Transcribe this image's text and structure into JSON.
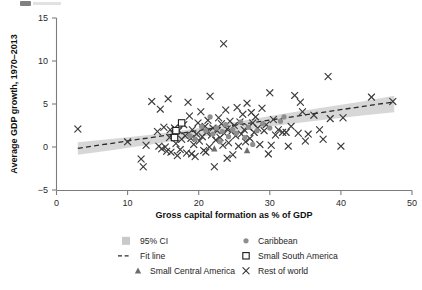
{
  "figure": {
    "name": "scatterplot-gdp-growth-vs-capital-formation"
  },
  "chart_data": {
    "type": "scatter",
    "title": "",
    "xlabel": "Gross capital formation as % of GDP",
    "ylabel": "Average GDP growth, 1970–2013",
    "xlim": [
      0,
      50
    ],
    "ylim": [
      -5,
      15
    ],
    "xticks": [
      0,
      10,
      20,
      30,
      40,
      50
    ],
    "yticks": [
      -5,
      0,
      5,
      10,
      15
    ],
    "xticklabels": [
      "0",
      "10",
      "20",
      "30",
      "40",
      "50"
    ],
    "yticklabels": [
      "−5",
      "0",
      "5",
      "10",
      "15"
    ],
    "grid": false,
    "legend_position": "below-axis",
    "fit_line": {
      "label": "Fit line",
      "style": "dashed",
      "color": "#2a2a2a",
      "x": [
        3.0,
        47.5
      ],
      "y": [
        -0.15,
        5.25
      ],
      "slope": 0.1213,
      "intercept": -0.514
    },
    "confidence_band": {
      "label": "95% CI",
      "level": 0.95,
      "color": "#c9c9c9",
      "x": [
        3.0,
        8.0,
        13.0,
        18.0,
        23.0,
        28.0,
        33.0,
        38.0,
        43.0,
        47.5
      ],
      "upper": [
        0.55,
        0.95,
        1.4,
        1.95,
        2.6,
        3.3,
        4.0,
        4.65,
        5.3,
        5.95
      ],
      "lower": [
        -0.9,
        -0.35,
        0.25,
        0.9,
        1.55,
        2.15,
        2.7,
        3.2,
        3.65,
        4.05
      ]
    },
    "series": [
      {
        "name": "Rest of world",
        "marker": "x",
        "color": "#3a3a3a",
        "points": [
          [
            3.0,
            2.1
          ],
          [
            10.0,
            0.6
          ],
          [
            11.9,
            -1.4
          ],
          [
            12.2,
            -2.3
          ],
          [
            12.6,
            0.2
          ],
          [
            13.4,
            5.3
          ],
          [
            14.2,
            1.8
          ],
          [
            14.4,
            0.1
          ],
          [
            14.6,
            4.4
          ],
          [
            14.8,
            -0.2
          ],
          [
            15.1,
            2.3
          ],
          [
            15.3,
            0.0
          ],
          [
            15.5,
            -0.5
          ],
          [
            15.7,
            5.6
          ],
          [
            15.9,
            1.1
          ],
          [
            16.1,
            -0.6
          ],
          [
            16.4,
            1.6
          ],
          [
            16.6,
            2.2
          ],
          [
            16.8,
            0.4
          ],
          [
            17.0,
            -1.0
          ],
          [
            17.2,
            1.9
          ],
          [
            17.4,
            -0.3
          ],
          [
            17.6,
            0.9
          ],
          [
            17.9,
            2.6
          ],
          [
            18.1,
            1.3
          ],
          [
            18.3,
            -0.7
          ],
          [
            18.5,
            5.2
          ],
          [
            18.7,
            3.6
          ],
          [
            18.9,
            1.0
          ],
          [
            19.1,
            2.0
          ],
          [
            19.3,
            0.3
          ],
          [
            19.5,
            -1.1
          ],
          [
            19.7,
            1.5
          ],
          [
            19.9,
            2.8
          ],
          [
            20.1,
            0.7
          ],
          [
            20.3,
            4.1
          ],
          [
            20.5,
            1.2
          ],
          [
            20.7,
            -0.4
          ],
          [
            20.9,
            2.4
          ],
          [
            21.1,
            1.7
          ],
          [
            21.3,
            3.1
          ],
          [
            21.5,
            0.0
          ],
          [
            21.6,
            5.9
          ],
          [
            21.8,
            1.4
          ],
          [
            22.0,
            2.2
          ],
          [
            22.2,
            -2.3
          ],
          [
            22.4,
            0.8
          ],
          [
            22.6,
            1.9
          ],
          [
            22.8,
            3.4
          ],
          [
            23.0,
            1.1
          ],
          [
            23.2,
            2.7
          ],
          [
            23.4,
            0.2
          ],
          [
            23.5,
            12.0
          ],
          [
            23.6,
            1.6
          ],
          [
            23.8,
            4.3
          ],
          [
            24.0,
            2.1
          ],
          [
            24.2,
            0.5
          ],
          [
            24.4,
            3.0
          ],
          [
            24.6,
            1.8
          ],
          [
            24.8,
            -0.9
          ],
          [
            25.0,
            2.5
          ],
          [
            25.2,
            1.3
          ],
          [
            25.4,
            4.6
          ],
          [
            25.6,
            0.1
          ],
          [
            25.8,
            2.9
          ],
          [
            26.0,
            1.5
          ],
          [
            26.2,
            3.8
          ],
          [
            26.4,
            2.0
          ],
          [
            26.6,
            0.6
          ],
          [
            26.8,
            5.1
          ],
          [
            27.0,
            2.3
          ],
          [
            27.2,
            1.0
          ],
          [
            27.4,
            4.0
          ],
          [
            27.6,
            2.8
          ],
          [
            27.8,
            1.7
          ],
          [
            28.0,
            3.5
          ],
          [
            28.3,
            2.2
          ],
          [
            28.6,
            0.3
          ],
          [
            28.9,
            4.5
          ],
          [
            29.2,
            1.9
          ],
          [
            29.5,
            2.6
          ],
          [
            29.8,
            -0.8
          ],
          [
            30.0,
            6.3
          ],
          [
            30.2,
            0.2
          ],
          [
            30.5,
            3.2
          ],
          [
            30.8,
            1.4
          ],
          [
            31.2,
            2.0
          ],
          [
            31.8,
            1.7
          ],
          [
            32.3,
            1.7
          ],
          [
            32.6,
            0.1
          ],
          [
            33.0,
            2.4
          ],
          [
            33.5,
            6.0
          ],
          [
            34.0,
            1.6
          ],
          [
            34.3,
            5.2
          ],
          [
            34.6,
            4.1
          ],
          [
            35.0,
            0.7
          ],
          [
            35.4,
            1.5
          ],
          [
            36.2,
            3.7
          ],
          [
            37.0,
            2.0
          ],
          [
            37.5,
            0.9
          ],
          [
            38.2,
            8.2
          ],
          [
            38.5,
            3.3
          ],
          [
            40.0,
            0.1
          ],
          [
            40.3,
            3.4
          ],
          [
            44.3,
            5.8
          ],
          [
            47.3,
            5.3
          ],
          [
            21.0,
            -0.6
          ],
          [
            19.0,
            -0.8
          ],
          [
            16.0,
            2.0
          ],
          [
            24.0,
            -1.3
          ]
        ]
      },
      {
        "name": "Caribbean",
        "marker": "circle",
        "color": "#8e8e8e",
        "points": [
          [
            20.4,
            2.4
          ],
          [
            21.0,
            1.9
          ],
          [
            21.6,
            3.5
          ],
          [
            22.0,
            1.5
          ],
          [
            22.5,
            2.2
          ],
          [
            23.0,
            0.6
          ],
          [
            23.3,
            1.8
          ],
          [
            23.8,
            2.6
          ],
          [
            24.2,
            1.2
          ],
          [
            24.8,
            2.0
          ],
          [
            25.3,
            1.6
          ],
          [
            25.9,
            2.9
          ],
          [
            26.5,
            1.1
          ],
          [
            27.0,
            2.3
          ],
          [
            27.6,
            0.3
          ],
          [
            28.2,
            1.9
          ],
          [
            29.0,
            2.7
          ],
          [
            30.0,
            2.2
          ],
          [
            31.5,
            3.0
          ],
          [
            32.0,
            3.5
          ],
          [
            18.8,
            1.3
          ],
          [
            19.5,
            0.9
          ]
        ]
      },
      {
        "name": "Small South America",
        "marker": "open-square",
        "color": "#1d1d1d",
        "points": [
          [
            17.6,
            2.8
          ],
          [
            16.8,
            1.9
          ],
          [
            16.6,
            1.1
          ]
        ]
      },
      {
        "name": "Small Central America",
        "marker": "triangle",
        "color": "#6d6d6d",
        "points": [
          [
            22.2,
            -0.2
          ],
          [
            26.8,
            -0.4
          ]
        ]
      }
    ]
  },
  "legend": {
    "items": [
      {
        "label": "95% CI",
        "marker": "ci-swatch"
      },
      {
        "label": "Caribbean",
        "marker": "circle"
      },
      {
        "label": "Fit line",
        "marker": "dashed-line"
      },
      {
        "label": "Small South America",
        "marker": "open-square"
      },
      {
        "label": "Small Central America",
        "marker": "triangle"
      },
      {
        "label": "Rest of world",
        "marker": "x"
      }
    ]
  },
  "colors": {
    "ci_band": "#c9c9c9",
    "fit_line": "#2a2a2a",
    "rest_of_world": "#3a3a3a",
    "caribbean": "#8e8e8e",
    "small_south_america": "#1d1d1d",
    "small_central_america": "#6d6d6d",
    "axis": "#7c7c7c",
    "background": "#ffffff"
  }
}
